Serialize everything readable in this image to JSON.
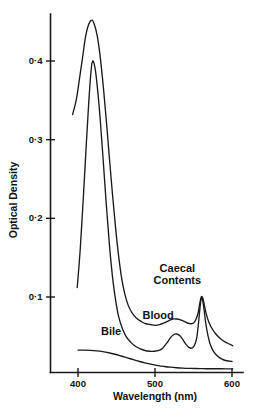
{
  "chart_data": {
    "type": "line",
    "title": "",
    "xlabel": "Wavelength (nm)",
    "ylabel": "Optical Density",
    "xlim": [
      385,
      605
    ],
    "ylim": [
      0,
      0.475
    ],
    "grid": false,
    "legend_position": "inline-annotations",
    "x_ticks": [
      {
        "value": 400,
        "label": "400"
      },
      {
        "value": 500,
        "label": "500"
      },
      {
        "value": 600,
        "label": "600"
      }
    ],
    "y_ticks": [
      {
        "value": 0.1,
        "label": "0·1"
      },
      {
        "value": 0.2,
        "label": "0·2"
      },
      {
        "value": 0.3,
        "label": "0·3"
      },
      {
        "value": 0.4,
        "label": "0·4"
      }
    ],
    "series": [
      {
        "name": "Caecal Contents",
        "label": "Caecal Contents",
        "label_lines": [
          "Caecal",
          "Contents"
        ],
        "soret_peak_nm": 418,
        "soret_peak_od": 0.452,
        "alpha_peak_nm": 560,
        "alpha_peak_od": 0.1,
        "points": [
          [
            393,
            0.332
          ],
          [
            398,
            0.352
          ],
          [
            402,
            0.378
          ],
          [
            406,
            0.405
          ],
          [
            410,
            0.432
          ],
          [
            414,
            0.447
          ],
          [
            418,
            0.452
          ],
          [
            421,
            0.447
          ],
          [
            425,
            0.432
          ],
          [
            429,
            0.404
          ],
          [
            433,
            0.366
          ],
          [
            437,
            0.322
          ],
          [
            441,
            0.274
          ],
          [
            445,
            0.228
          ],
          [
            449,
            0.186
          ],
          [
            453,
            0.15
          ],
          [
            457,
            0.122
          ],
          [
            461,
            0.103
          ],
          [
            465,
            0.09
          ],
          [
            470,
            0.08
          ],
          [
            476,
            0.073
          ],
          [
            482,
            0.069
          ],
          [
            488,
            0.066
          ],
          [
            494,
            0.065
          ],
          [
            500,
            0.064
          ],
          [
            506,
            0.065
          ],
          [
            512,
            0.067
          ],
          [
            518,
            0.07
          ],
          [
            523,
            0.072
          ],
          [
            528,
            0.072
          ],
          [
            533,
            0.071
          ],
          [
            538,
            0.069
          ],
          [
            542,
            0.067
          ],
          [
            546,
            0.066
          ],
          [
            550,
            0.067
          ],
          [
            553,
            0.071
          ],
          [
            556,
            0.08
          ],
          [
            558,
            0.091
          ],
          [
            560,
            0.1
          ],
          [
            562,
            0.099
          ],
          [
            564,
            0.09
          ],
          [
            567,
            0.077
          ],
          [
            570,
            0.068
          ],
          [
            574,
            0.06
          ],
          [
            579,
            0.053
          ],
          [
            585,
            0.047
          ],
          [
            591,
            0.043
          ],
          [
            597,
            0.04
          ],
          [
            601,
            0.038
          ]
        ]
      },
      {
        "name": "Blood",
        "label": "Blood",
        "label_lines": [
          "Blood"
        ],
        "soret_peak_nm": 419,
        "soret_peak_od": 0.4,
        "alpha_peak_nm": 560,
        "alpha_peak_od": 0.098,
        "points": [
          [
            399,
            0.112
          ],
          [
            403,
            0.162
          ],
          [
            407,
            0.228
          ],
          [
            411,
            0.298
          ],
          [
            414,
            0.348
          ],
          [
            417,
            0.388
          ],
          [
            419,
            0.4
          ],
          [
            422,
            0.392
          ],
          [
            425,
            0.368
          ],
          [
            429,
            0.324
          ],
          [
            433,
            0.27
          ],
          [
            437,
            0.214
          ],
          [
            441,
            0.164
          ],
          [
            445,
            0.124
          ],
          [
            449,
            0.095
          ],
          [
            453,
            0.074
          ],
          [
            458,
            0.059
          ],
          [
            463,
            0.049
          ],
          [
            469,
            0.042
          ],
          [
            475,
            0.037
          ],
          [
            481,
            0.034
          ],
          [
            487,
            0.032
          ],
          [
            493,
            0.031
          ],
          [
            499,
            0.031
          ],
          [
            505,
            0.032
          ],
          [
            510,
            0.035
          ],
          [
            515,
            0.041
          ],
          [
            520,
            0.048
          ],
          [
            524,
            0.052
          ],
          [
            528,
            0.053
          ],
          [
            532,
            0.051
          ],
          [
            536,
            0.046
          ],
          [
            540,
            0.04
          ],
          [
            544,
            0.036
          ],
          [
            548,
            0.035
          ],
          [
            551,
            0.038
          ],
          [
            554,
            0.047
          ],
          [
            556,
            0.062
          ],
          [
            558,
            0.082
          ],
          [
            560,
            0.098
          ],
          [
            562,
            0.095
          ],
          [
            564,
            0.082
          ],
          [
            566,
            0.066
          ],
          [
            569,
            0.05
          ],
          [
            572,
            0.039
          ],
          [
            576,
            0.031
          ],
          [
            581,
            0.025
          ],
          [
            587,
            0.021
          ],
          [
            593,
            0.019
          ],
          [
            600,
            0.018
          ]
        ]
      },
      {
        "name": "Bile",
        "label": "Bile",
        "label_lines": [
          "Bile"
        ],
        "points": [
          [
            400,
            0.0325
          ],
          [
            408,
            0.0325
          ],
          [
            416,
            0.0322
          ],
          [
            424,
            0.0316
          ],
          [
            432,
            0.0306
          ],
          [
            440,
            0.0291
          ],
          [
            448,
            0.0272
          ],
          [
            456,
            0.025
          ],
          [
            464,
            0.0227
          ],
          [
            472,
            0.0203
          ],
          [
            480,
            0.018
          ],
          [
            488,
            0.016
          ],
          [
            496,
            0.0143
          ],
          [
            504,
            0.0128
          ],
          [
            512,
            0.0117
          ],
          [
            520,
            0.0108
          ],
          [
            528,
            0.0101
          ],
          [
            536,
            0.0096
          ],
          [
            544,
            0.0093
          ],
          [
            552,
            0.0091
          ],
          [
            562,
            0.0089
          ],
          [
            572,
            0.0088
          ],
          [
            582,
            0.0088
          ],
          [
            592,
            0.0087
          ],
          [
            601,
            0.0087
          ]
        ]
      }
    ],
    "annotations": [
      {
        "name": "caecal-contents-label",
        "text_lines": [
          "Caecal",
          "Contents"
        ],
        "x_nm": 529,
        "y_od": 0.132
      },
      {
        "name": "blood-label",
        "text_lines": [
          "Blood"
        ],
        "x_nm": 504,
        "y_od": 0.072
      },
      {
        "name": "bile-label",
        "text_lines": [
          "Bile"
        ],
        "x_nm": 443,
        "y_od": 0.052
      }
    ],
    "colors": {
      "curve": "#1a1a1a",
      "axis": "#1a1a1a",
      "text": "#111111",
      "background": "#ffffff"
    }
  }
}
